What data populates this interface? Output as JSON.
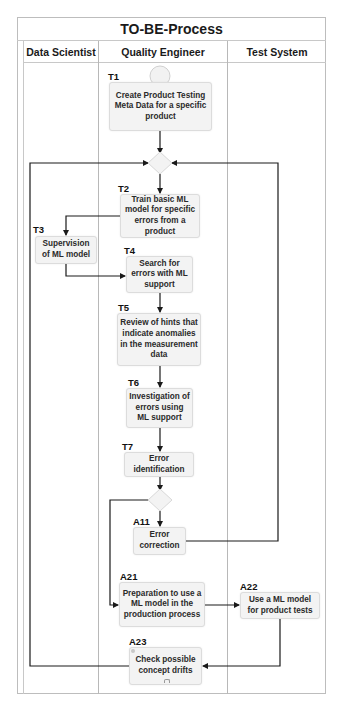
{
  "title": "TO-BE-Process",
  "lanes": [
    {
      "label": "Data Scientist"
    },
    {
      "label": "Quality Engineer"
    },
    {
      "label": "Test System"
    }
  ],
  "tasks": {
    "T1": {
      "id": "T1",
      "text": "Create Product Testing Meta Data for a specific product",
      "lane": "Quality Engineer"
    },
    "T2": {
      "id": "T2",
      "text": "Train basic ML model for specific errors from a product",
      "lane": "Quality Engineer"
    },
    "T3": {
      "id": "T3",
      "text": "Supervision of ML model",
      "lane": "Data Scientist"
    },
    "T4": {
      "id": "T4",
      "text": "Search for errors with ML support",
      "lane": "Quality Engineer"
    },
    "T5": {
      "id": "T5",
      "text": "Review of hints that indicate anomalies in the measurement data",
      "lane": "Quality Engineer"
    },
    "T6": {
      "id": "T6",
      "text": "Investigation of errors using ML support",
      "lane": "Quality Engineer"
    },
    "T7": {
      "id": "T7",
      "text": "Error identification",
      "lane": "Quality Engineer"
    },
    "A11": {
      "id": "A11",
      "text": "Error correction",
      "lane": "Quality Engineer"
    },
    "A21": {
      "id": "A21",
      "text": "Preparation to use a ML model in the production process",
      "lane": "Quality Engineer"
    },
    "A22": {
      "id": "A22",
      "text": "Use a ML model for product tests",
      "lane": "Test System"
    },
    "A23": {
      "id": "A23",
      "text": "Check possible concept drifts",
      "lane": "Quality Engineer"
    }
  },
  "colors": {
    "task_fill": "#f3f3f3",
    "task_border": "#dcdcdc",
    "line": "#1a1a1a",
    "lane_border": "#b8b8b8"
  }
}
